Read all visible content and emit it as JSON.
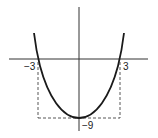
{
  "figure": {
    "x_intercepts": [
      -3,
      3
    ],
    "vertex": {
      "x": 0,
      "y": -9
    },
    "labels": {
      "left_intercept": "−3",
      "right_intercept": "3",
      "vertex_value": "−9"
    },
    "colors": {
      "curve": "#1a1a1a",
      "axes": "#333333",
      "dashed": "#444444"
    }
  }
}
